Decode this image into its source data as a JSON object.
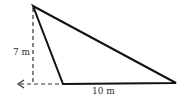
{
  "diagram": {
    "type": "obtuse-triangle-with-height",
    "labels": {
      "height": "7 m",
      "base": "10 m"
    },
    "colors": {
      "stroke": "#111111",
      "dashed": "#333333",
      "text": "#333333"
    }
  }
}
